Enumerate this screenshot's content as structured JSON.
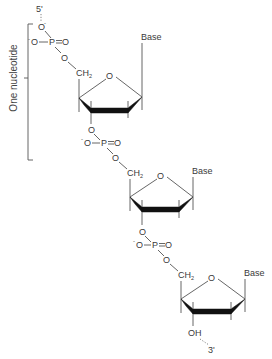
{
  "diagram": {
    "bracket_label": "One nucleotide",
    "ends": {
      "five_prime": "5'",
      "three_prime": "3'"
    },
    "atoms": {
      "oxygen": "O",
      "phosphorus": "P",
      "negative_oxygen": "O",
      "charge": "-",
      "double_bond_oxygen": "O",
      "ch2_c": "CH",
      "ch2_sub": "2",
      "hydroxyl": "OH",
      "base": "Base"
    },
    "nucleotides": [
      {
        "index": 1,
        "base_label": "Base",
        "sugar": "deoxyribose",
        "phosphate": "5' phosphate"
      },
      {
        "index": 2,
        "base_label": "Base",
        "sugar": "deoxyribose",
        "phosphate": "phosphodiester"
      },
      {
        "index": 3,
        "base_label": "Base",
        "sugar": "deoxyribose",
        "phosphate": "phosphodiester",
        "terminal": "3' OH"
      }
    ],
    "colors": {
      "line": "#555555",
      "wedge": "#111111",
      "text": "#3a3a3a",
      "background": "#ffffff"
    }
  }
}
